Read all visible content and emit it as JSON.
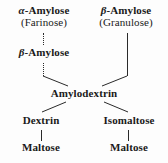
{
  "diagram": {
    "type": "flowchart",
    "background_color": "#fdfdfd",
    "text_color": "#1a1a1a",
    "line_color": "#2a2a2a",
    "nodes": [
      {
        "id": "alpha-amylose",
        "line1": "α-Amylose",
        "line2": "(Farinose)",
        "greek_prefix": "α",
        "name": "Amylose",
        "synonym": "Farinose"
      },
      {
        "id": "beta-amylose-top",
        "line1": "β-Amylose",
        "line2": "(Granulose)",
        "greek_prefix": "β",
        "name": "Amylose",
        "synonym": "Granulose"
      },
      {
        "id": "beta-amylose-mid",
        "line1": "β-Amylose",
        "line2": "",
        "greek_prefix": "β",
        "name": "Amylose",
        "synonym": ""
      },
      {
        "id": "amylodextrin",
        "line1": "Amylodextrin",
        "line2": "",
        "greek_prefix": "",
        "name": "Amylodextrin",
        "synonym": ""
      },
      {
        "id": "dextrin",
        "line1": "Dextrin",
        "line2": "",
        "greek_prefix": "",
        "name": "Dextrin",
        "synonym": ""
      },
      {
        "id": "isomaltose",
        "line1": "Isomaltose",
        "line2": "",
        "greek_prefix": "",
        "name": "Isomaltose",
        "synonym": ""
      },
      {
        "id": "maltose-left",
        "line1": "Maltose",
        "line2": "",
        "greek_prefix": "",
        "name": "Maltose",
        "synonym": ""
      },
      {
        "id": "maltose-right",
        "line1": "Maltose",
        "line2": "",
        "greek_prefix": "",
        "name": "Maltose",
        "synonym": ""
      }
    ],
    "edges": [
      {
        "id": "alpha-to-beta",
        "from": "alpha-amylose",
        "to": "beta-amylose-mid",
        "style": "dotted-vertical"
      },
      {
        "id": "beta-to-amylodextrin",
        "from": "beta-amylose-mid",
        "to": "amylodextrin",
        "style": "vertical-then-diagonal"
      },
      {
        "id": "betatop-to-amylodextrin",
        "from": "beta-amylose-top",
        "to": "amylodextrin",
        "style": "vertical-then-diagonal"
      },
      {
        "id": "amylodextrin-to-dextrin",
        "from": "amylodextrin",
        "to": "dextrin",
        "style": "diagonal"
      },
      {
        "id": "amylodextrin-to-isomaltose",
        "from": "amylodextrin",
        "to": "isomaltose",
        "style": "diagonal"
      },
      {
        "id": "dextrin-to-maltose",
        "from": "dextrin",
        "to": "maltose-left",
        "style": "vertical"
      },
      {
        "id": "isomaltose-to-maltose",
        "from": "isomaltose",
        "to": "maltose-right",
        "style": "vertical"
      }
    ]
  }
}
